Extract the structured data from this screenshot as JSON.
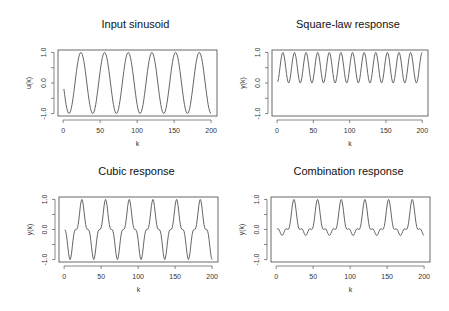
{
  "chart_data": [
    {
      "type": "line",
      "title": "Input sinusoid",
      "xlabel": "k",
      "ylabel": "u(k)",
      "xlim": [
        1,
        200
      ],
      "ylim": [
        -1,
        1
      ],
      "xticks": [
        "0",
        "50",
        "100",
        "150",
        "200"
      ],
      "yticks": [
        "-1.0",
        "0.0",
        "1.0"
      ],
      "formula": "u(k) = -sin(2*pi*k/32)",
      "period": 32,
      "peaks_k": [
        24,
        56,
        88,
        120,
        152,
        184
      ],
      "troughs_k": [
        8,
        40,
        72,
        104,
        136,
        168,
        200
      ]
    },
    {
      "type": "line",
      "title": "Square-law response",
      "xlabel": "k",
      "ylabel": "y(k)",
      "xlim": [
        1,
        200
      ],
      "ylim": [
        -1,
        1
      ],
      "xticks": [
        "0",
        "50",
        "100",
        "150",
        "200"
      ],
      "yticks": [
        "-1.0",
        "0.0",
        "1.0"
      ],
      "formula": "y(k) = u(k)^2",
      "range": [
        0,
        1
      ]
    },
    {
      "type": "line",
      "title": "Cubic response",
      "xlabel": "k",
      "ylabel": "y(k)",
      "xlim": [
        1,
        200
      ],
      "ylim": [
        -1,
        1
      ],
      "xticks": [
        "0",
        "50",
        "100",
        "150",
        "200"
      ],
      "yticks": [
        "-1.0",
        "0.0",
        "1.0"
      ],
      "formula": "y(k) = u(k)^3",
      "range": [
        -1,
        1
      ]
    },
    {
      "type": "line",
      "title": "Combination response",
      "xlabel": "k",
      "ylabel": "y(k)",
      "xlim": [
        1,
        200
      ],
      "ylim": [
        -1,
        1
      ],
      "xticks": [
        "0",
        "50",
        "100",
        "150",
        "200"
      ],
      "yticks": [
        "-1.0",
        "0.0",
        "1.0"
      ],
      "formula": "y(k) = 0.6*u(k)^3 + 0.4*u(k)^2",
      "range": [
        -0.2,
        1
      ]
    }
  ],
  "panels": [
    {
      "title": "Input sinusoid",
      "xlabel": "k",
      "ylabel": "u(k)"
    },
    {
      "title": "Square-law response",
      "xlabel": "k",
      "ylabel": "y(k)"
    },
    {
      "title": "Cubic response",
      "xlabel": "k",
      "ylabel": "y(k)"
    },
    {
      "title": "Combination response",
      "xlabel": "k",
      "ylabel": "y(k)"
    }
  ]
}
